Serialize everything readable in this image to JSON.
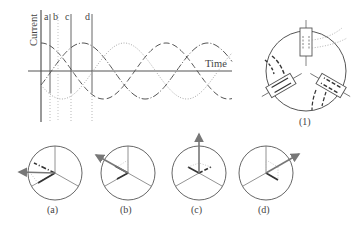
{
  "graph": {
    "y_axis_label": "Current",
    "x_axis_label": "Time",
    "markers": [
      {
        "label": "a",
        "x": 50
      },
      {
        "label": "b",
        "x": 58
      },
      {
        "label": "c",
        "x": 71
      },
      {
        "label": "d",
        "x": 92
      }
    ],
    "curves": [
      {
        "name": "phase-1",
        "style": "long-dash",
        "phase_deg": 90
      },
      {
        "name": "phase-2",
        "style": "dash-dot",
        "phase_deg": -30
      },
      {
        "name": "phase-3",
        "style": "dotted",
        "phase_deg": 210
      }
    ]
  },
  "motor": {
    "caption": "(1)"
  },
  "phasors": [
    {
      "caption": "(a)",
      "resultant_angle_deg": 180
    },
    {
      "caption": "(b)",
      "resultant_angle_deg": 150
    },
    {
      "caption": "(c)",
      "resultant_angle_deg": 90
    },
    {
      "caption": "(d)",
      "resultant_angle_deg": 30
    }
  ],
  "colors": {
    "line": "#555555",
    "arrow": "#777777",
    "dotted": "#aaaaaa"
  }
}
